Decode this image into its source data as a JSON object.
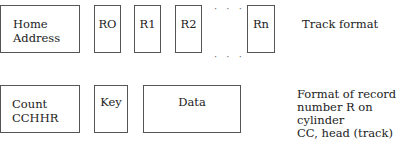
{
  "track_format": {
    "home_address": [
      "Home",
      "Address"
    ],
    "records": [
      "RO",
      "R1",
      "R2",
      "Rn"
    ],
    "ellipsis": "· · ·",
    "caption": "Track format"
  },
  "record_format": {
    "count": [
      "Count",
      "CCHHR"
    ],
    "key": "Key",
    "data": "Data",
    "caption": "Format of record\nnumber R on cylinder\nCC, head (track)\nnumber HH."
  }
}
